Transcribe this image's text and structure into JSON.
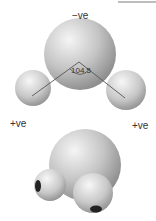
{
  "diagram": {
    "labels": {
      "oxygen_charge": "−ve",
      "hydrogen_left_charge": "+ve",
      "hydrogen_right_charge": "+ve",
      "bond_angle": "104.5"
    },
    "colors": {
      "atom_light": "#f2f2f2",
      "atom_dark": "#8f8f8f",
      "line": "#555555",
      "text": "#333333"
    }
  }
}
